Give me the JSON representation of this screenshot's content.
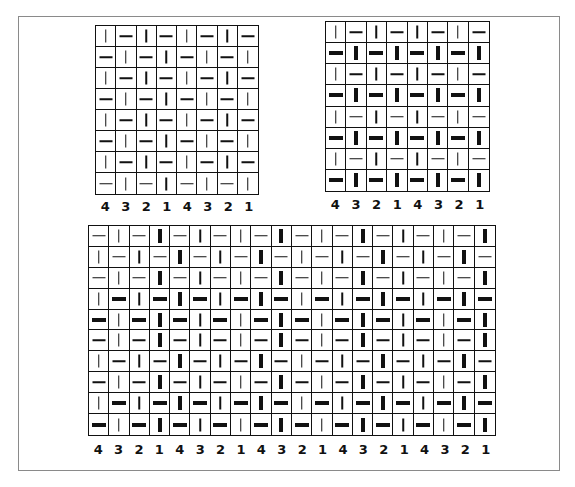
{
  "legend": {
    "v": "thin vertical stroke",
    "h": "thin horizontal stroke",
    "V": "thick vertical stroke",
    "H": "thick horizontal stroke"
  },
  "charts": [
    {
      "id": "top-left",
      "box": {
        "left": 95,
        "top": 25,
        "width": 164,
        "height": 170
      },
      "labels_top": 199,
      "cols": 8,
      "rows": [
        [
          "v",
          "h",
          "v",
          "h",
          "v",
          "h",
          "v",
          "h"
        ],
        [
          "h",
          "v",
          "h",
          "v",
          "h",
          "v",
          "h",
          "v"
        ],
        [
          "v",
          "h",
          "v",
          "h",
          "v",
          "h",
          "v",
          "h"
        ],
        [
          "h",
          "v",
          "h",
          "v",
          "h",
          "v",
          "h",
          "v"
        ],
        [
          "v",
          "h",
          "v",
          "h",
          "v",
          "h",
          "v",
          "h"
        ],
        [
          "h",
          "v",
          "h",
          "v",
          "h",
          "v",
          "h",
          "v"
        ],
        [
          "v",
          "h",
          "v",
          "h",
          "v",
          "h",
          "v",
          "h"
        ],
        [
          "h",
          "v",
          "h",
          "v",
          "h",
          "v",
          "h",
          "v"
        ]
      ],
      "column_labels": [
        "4",
        "3",
        "2",
        "1",
        "4",
        "3",
        "2",
        "1"
      ]
    },
    {
      "id": "top-right",
      "box": {
        "left": 325,
        "top": 21,
        "width": 165,
        "height": 171
      },
      "labels_top": 197,
      "cols": 8,
      "rows": [
        [
          "v",
          "h",
          "v",
          "h",
          "v",
          "h",
          "v",
          "h"
        ],
        [
          "H",
          "V",
          "H",
          "V",
          "H",
          "V",
          "H",
          "V"
        ],
        [
          "v",
          "h",
          "v",
          "h",
          "v",
          "h",
          "v",
          "h"
        ],
        [
          "H",
          "V",
          "H",
          "V",
          "H",
          "V",
          "H",
          "V"
        ],
        [
          "v",
          "h",
          "v",
          "h",
          "v",
          "h",
          "v",
          "h"
        ],
        [
          "H",
          "V",
          "H",
          "V",
          "H",
          "V",
          "H",
          "V"
        ],
        [
          "v",
          "h",
          "v",
          "h",
          "v",
          "h",
          "v",
          "h"
        ],
        [
          "H",
          "V",
          "H",
          "V",
          "H",
          "V",
          "H",
          "V"
        ]
      ],
      "column_labels": [
        "4",
        "3",
        "2",
        "1",
        "4",
        "3",
        "2",
        "1"
      ]
    },
    {
      "id": "bottom",
      "box": {
        "left": 88,
        "top": 225,
        "width": 408,
        "height": 211
      },
      "labels_top": 442,
      "cols": 20,
      "rows": [
        [
          "h",
          "v",
          "h",
          "V",
          "h",
          "v",
          "h",
          "v",
          "h",
          "V",
          "h",
          "v",
          "h",
          "V",
          "h",
          "v",
          "h",
          "v",
          "h",
          "V"
        ],
        [
          "v",
          "h",
          "v",
          "h",
          "V",
          "h",
          "v",
          "h",
          "V",
          "h",
          "v",
          "h",
          "v",
          "h",
          "V",
          "h",
          "v",
          "h",
          "V",
          "h"
        ],
        [
          "h",
          "v",
          "h",
          "V",
          "h",
          "v",
          "h",
          "v",
          "h",
          "V",
          "h",
          "v",
          "h",
          "V",
          "h",
          "v",
          "h",
          "v",
          "h",
          "V"
        ],
        [
          "v",
          "H",
          "v",
          "H",
          "V",
          "H",
          "v",
          "H",
          "V",
          "H",
          "v",
          "H",
          "v",
          "H",
          "V",
          "H",
          "v",
          "H",
          "V",
          "H"
        ],
        [
          "H",
          "v",
          "H",
          "V",
          "H",
          "v",
          "H",
          "v",
          "H",
          "V",
          "H",
          "v",
          "H",
          "V",
          "H",
          "v",
          "H",
          "v",
          "H",
          "V"
        ],
        [
          "h",
          "v",
          "h",
          "V",
          "h",
          "v",
          "h",
          "v",
          "h",
          "V",
          "h",
          "v",
          "h",
          "V",
          "h",
          "v",
          "h",
          "v",
          "h",
          "V"
        ],
        [
          "v",
          "h",
          "v",
          "h",
          "V",
          "h",
          "v",
          "h",
          "V",
          "h",
          "v",
          "h",
          "v",
          "h",
          "V",
          "h",
          "v",
          "h",
          "V",
          "h"
        ],
        [
          "h",
          "v",
          "h",
          "V",
          "h",
          "v",
          "h",
          "v",
          "h",
          "V",
          "h",
          "v",
          "h",
          "V",
          "h",
          "v",
          "h",
          "v",
          "h",
          "V"
        ],
        [
          "v",
          "H",
          "v",
          "H",
          "V",
          "H",
          "v",
          "H",
          "V",
          "H",
          "v",
          "H",
          "v",
          "H",
          "V",
          "H",
          "v",
          "H",
          "V",
          "H"
        ],
        [
          "H",
          "v",
          "H",
          "V",
          "H",
          "v",
          "H",
          "v",
          "H",
          "V",
          "H",
          "v",
          "H",
          "V",
          "H",
          "v",
          "H",
          "v",
          "H",
          "V"
        ]
      ],
      "column_labels": [
        "4",
        "3",
        "2",
        "1",
        "4",
        "3",
        "2",
        "1",
        "4",
        "3",
        "2",
        "1",
        "4",
        "3",
        "2",
        "1",
        "4",
        "3",
        "2",
        "1"
      ]
    }
  ]
}
